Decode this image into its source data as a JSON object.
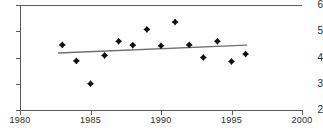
{
  "chart_data": {
    "type": "scatter",
    "title": "",
    "subtitle": "",
    "xlabel": "",
    "ylabel": "",
    "xlim": [
      1980,
      2000
    ],
    "ylim": [
      2,
      6
    ],
    "grid": false,
    "legend": null,
    "x_ticks": [
      1980,
      1985,
      1990,
      1995,
      2000
    ],
    "y_ticks": [
      2,
      3,
      4,
      5,
      6
    ],
    "marker": "diamond",
    "marker_color": "#111111",
    "series": [
      {
        "name": "observations",
        "x": [
          1983,
          1984,
          1985,
          1986,
          1987,
          1988,
          1989,
          1990,
          1991,
          1992,
          1993,
          1994,
          1995,
          1996
        ],
        "values": [
          4.48,
          3.87,
          3.0,
          4.08,
          4.62,
          4.47,
          5.07,
          4.45,
          5.35,
          4.48,
          4.0,
          4.62,
          3.85,
          4.13
        ]
      }
    ],
    "trendline": {
      "name": "linear fit",
      "color": "#6e6e6e",
      "x_start": 1982.7,
      "y_start": 4.17,
      "x_end": 1996.1,
      "y_end": 4.47
    }
  },
  "axis": {
    "y_tick_labels": [
      "6",
      "5",
      "4",
      "3",
      "2"
    ],
    "x_tick_labels": [
      "1980",
      "1985",
      "1990",
      "1995",
      "2000"
    ]
  }
}
